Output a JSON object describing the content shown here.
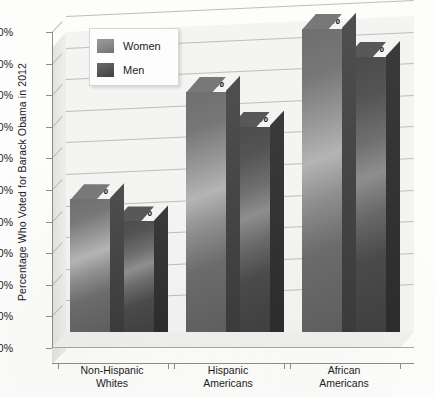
{
  "chart_data": {
    "type": "bar",
    "title": "",
    "xlabel": "",
    "ylabel": "Percentage Who Voted for Barack Obama in 2012",
    "categories": [
      "Non-Hispanic Whites",
      "Hispanic Americans",
      "African Americans"
    ],
    "category_lines": [
      [
        "Non-Hispanic",
        "Whites"
      ],
      [
        "Hispanic",
        "Americans"
      ],
      [
        "African",
        "Americans"
      ]
    ],
    "series": [
      {
        "name": "Women",
        "values": [
          42,
          76,
          96
        ],
        "labels": [
          "42%",
          "35%",
          "76%"
        ],
        "color": "#8a8a8a"
      },
      {
        "name": "Men",
        "values": [
          35,
          65,
          87
        ],
        "color": "#565656"
      }
    ],
    "value_labels": {
      "women": [
        "42%",
        "76%",
        "96%"
      ],
      "men": [
        "35%",
        "65%",
        "87%"
      ]
    },
    "ylim": [
      0,
      100
    ],
    "ytick_labels": [
      "0%",
      "10%",
      "20%",
      "30%",
      "40%",
      "50%",
      "60%",
      "70%",
      "80%",
      "90%",
      "100%"
    ],
    "ytick_values": [
      0,
      10,
      20,
      30,
      40,
      50,
      60,
      70,
      80,
      90,
      100
    ],
    "grid": true,
    "legend_position": "top-left-inside",
    "style": "3d-clustered-column"
  },
  "legend": {
    "items": [
      {
        "label": "Women",
        "color": "#8a8a8a"
      },
      {
        "label": "Men",
        "color": "#565656"
      }
    ]
  },
  "colors": {
    "plot_background": "#f4f4f2",
    "gridline": "#bdbdba",
    "axis": "#8c8c88",
    "text": "#1c1c1c",
    "women_bar": "#8a8a8a",
    "men_bar": "#565656"
  }
}
